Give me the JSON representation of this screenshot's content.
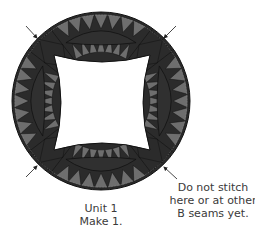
{
  "diagram": {
    "center": [
      101,
      101
    ],
    "outer_radius": 89,
    "band_width": 40,
    "inner_opening": {
      "left": 54,
      "top": 55,
      "right": 150,
      "bottom": 150
    },
    "arcs": [
      "top",
      "right",
      "bottom",
      "left"
    ],
    "triangles_per_edge": 7,
    "corner_blocks": [
      "top-left",
      "top-right",
      "bottom-left",
      "bottom-right"
    ],
    "arrows": [
      {
        "name": "top-left",
        "from": [
          26,
          26
        ],
        "to": [
          37,
          38
        ]
      },
      {
        "name": "top-right",
        "from": [
          176,
          26
        ],
        "to": [
          164,
          38
        ]
      },
      {
        "name": "bottom-left",
        "from": [
          26,
          177
        ],
        "to": [
          37,
          166
        ]
      },
      {
        "name": "bottom-right",
        "from": [
          177,
          179
        ],
        "to": [
          164,
          167
        ]
      }
    ],
    "colors": {
      "dark": "#2b2b2b",
      "melon": "#303030",
      "triangle_light": "#6e6e6e",
      "outline": "#111111",
      "arrow": "#333333",
      "text": "#3a3a3a"
    }
  },
  "captions": {
    "unit": {
      "line1": "Unit 1",
      "line2": "Make 1."
    },
    "note": {
      "line1": "Do not stitch",
      "line2": "here or at other",
      "line3": "B seams yet."
    }
  }
}
